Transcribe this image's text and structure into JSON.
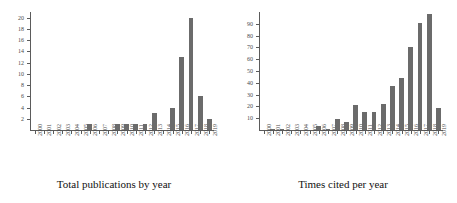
{
  "figure": {
    "background_color": "#ffffff",
    "bar_color": "#6b6b6b",
    "axis_color": "#5b5b5b",
    "text_color": "#1a1a1a"
  },
  "panels": [
    {
      "id": "total-publications",
      "caption": "Total publications by year"
    },
    {
      "id": "times-cited",
      "caption": "Times cited per year"
    }
  ],
  "chart_data": [
    {
      "type": "bar",
      "title": "Total publications by year",
      "xlabel": "",
      "ylabel": "",
      "grid": false,
      "legend": "none",
      "categories": [
        "2000",
        "2001",
        "2002",
        "2003",
        "2004",
        "2005",
        "2006",
        "2007",
        "2008",
        "2009",
        "2010",
        "2011",
        "2012",
        "2013",
        "2014",
        "2015",
        "2016",
        "2017",
        "2018",
        "2019"
      ],
      "values": [
        0,
        0,
        0,
        0,
        0,
        0,
        1,
        0,
        0,
        1,
        1,
        1,
        1,
        3,
        0,
        4,
        13,
        20,
        6,
        2
      ],
      "ylim": [
        0,
        21
      ],
      "yticks": [
        2,
        4,
        6,
        8,
        10,
        12,
        14,
        16,
        18,
        20
      ],
      "ytick_labels": [
        "2",
        "4",
        "6",
        "8",
        "10",
        "12",
        "14",
        "16",
        "18",
        "20"
      ]
    },
    {
      "type": "bar",
      "title": "Times cited per year",
      "xlabel": "",
      "ylabel": "",
      "grid": false,
      "legend": "none",
      "categories": [
        "2000",
        "2001",
        "2002",
        "2003",
        "2004",
        "2005",
        "2006",
        "2007",
        "2008",
        "2009",
        "2010",
        "2011",
        "2012",
        "2013",
        "2014",
        "2015",
        "2016",
        "2017",
        "2018",
        "2019"
      ],
      "values": [
        0,
        1,
        1,
        0,
        0,
        0,
        3,
        1,
        9,
        7,
        21,
        15,
        15,
        22,
        37,
        44,
        70,
        91,
        98,
        19
      ],
      "ylim": [
        0,
        100
      ],
      "yticks": [
        10,
        20,
        30,
        40,
        50,
        60,
        70,
        80,
        90
      ],
      "ytick_labels": [
        "10",
        "20",
        "30",
        "40",
        "50",
        "60",
        "70",
        "80",
        "90"
      ]
    }
  ]
}
